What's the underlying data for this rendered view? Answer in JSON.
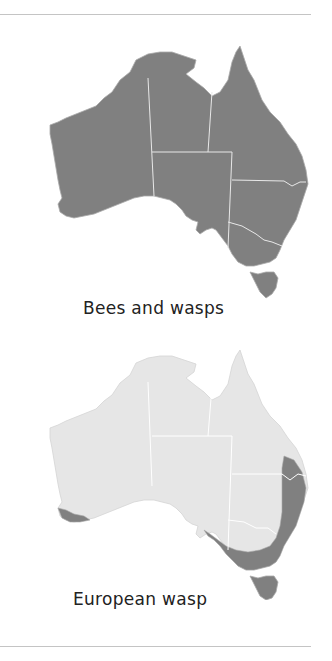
{
  "figure": {
    "panels": [
      {
        "caption": "Bees and wasps",
        "distribution": "entire mainland and Tasmania",
        "colors": {
          "base": "#808080",
          "highlight": "#808080",
          "border": "#e8e8e8"
        }
      },
      {
        "caption": "European wasp",
        "distribution": "south-west WA coast, south-east coast from SA to southern QLD, and Tasmania",
        "colors": {
          "base": "#e6e6e6",
          "highlight": "#808080",
          "border": "#ffffff"
        }
      }
    ],
    "rule_color": "#c4c4c4"
  }
}
